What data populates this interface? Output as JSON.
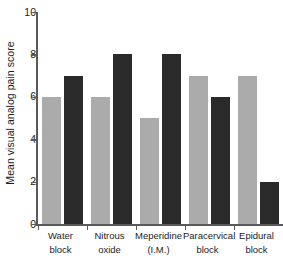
{
  "chart_data": {
    "type": "bar",
    "title": "",
    "subtitle": "",
    "xlabel": "",
    "ylabel": "Mean visual analog pain score",
    "ylim": [
      0,
      10
    ],
    "yticks": [
      0,
      2,
      4,
      6,
      8,
      10
    ],
    "ytick_labels": [
      "0",
      "2",
      "4",
      "6",
      "8",
      "10"
    ],
    "grid": false,
    "legend": null,
    "legend_position": "none",
    "categories": [
      "Water block",
      "Nitrous oxide",
      "Meperidine (I.M.)",
      "Paracervical block",
      "Epidural block"
    ],
    "category_lines": [
      [
        "Water",
        "block"
      ],
      [
        "Nitrous",
        "oxide"
      ],
      [
        "Meperidine",
        "(I.M.)"
      ],
      [
        "Paracervical",
        "block"
      ],
      [
        "Epidural",
        "block"
      ]
    ],
    "series": [
      {
        "name": "series-light",
        "color": "#ababab",
        "values": [
          6,
          6,
          5,
          7,
          7
        ]
      },
      {
        "name": "series-dark",
        "color": "#2a2a2a",
        "values": [
          7,
          8,
          8,
          6,
          2
        ]
      }
    ],
    "bars_in_order": [
      {
        "category": "Water block",
        "series": "series-light",
        "value": 6
      },
      {
        "category": "Water block",
        "series": "series-dark",
        "value": 7
      },
      {
        "category": "Nitrous oxide",
        "series": "series-light",
        "value": 6
      },
      {
        "category": "Nitrous oxide",
        "series": "series-dark",
        "value": 8
      },
      {
        "category": "Meperidine (I.M.)",
        "series": "series-light",
        "value": 5
      },
      {
        "category": "Meperidine (I.M.)",
        "series": "series-dark",
        "value": 8
      },
      {
        "category": "Paracervical block",
        "series": "series-light",
        "value": 7
      },
      {
        "category": "Paracervical block",
        "series": "series-dark",
        "value": 6
      },
      {
        "category": "Epidural block",
        "series": "series-light",
        "value": 7
      },
      {
        "category": "Epidural block",
        "series": "series-dark",
        "value": 2
      }
    ]
  },
  "colors": {
    "background": "#ffffff",
    "axis": "#5a5a5a",
    "text": "#1d1d1d",
    "bar_light": "#ababab",
    "bar_dark": "#2a2a2a"
  }
}
